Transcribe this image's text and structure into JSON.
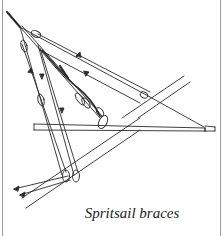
{
  "figure": {
    "caption": "Spritsail braces",
    "colors": {
      "ink": "#2a2a2a",
      "frame": "#9a9a9a",
      "background": "#ffffff"
    },
    "elements": [
      "bowsprit",
      "spritsail-yard",
      "spritsail-braces",
      "blocks",
      "stay-seizing"
    ]
  }
}
